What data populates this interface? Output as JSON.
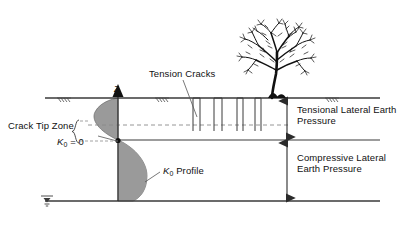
{
  "diagram": {
    "colors": {
      "line": "#3a3a3a",
      "shade_fill": "#9a9a9a",
      "dashed": "#808080",
      "text": "#111111",
      "tree": "#111111"
    },
    "labels": {
      "tension_cracks": "Tension Cracks",
      "crack_tip_zone": "Crack Tip Zone",
      "k0_zero_k": "K",
      "k0_zero_sub": "0",
      "k0_zero_eq": " = 0",
      "k0_profile_k": "K",
      "k0_profile_sub": "0",
      "k0_profile_rest": " Profile",
      "depth_axis": "z",
      "tensional_pressure": "Tensional Lateral Earth Pressure",
      "compressive_pressure": "Compressive Lateral Earth Pressure"
    },
    "icons": {
      "tree": "tree-icon",
      "water_table": "water-table-icon",
      "ground_hatch": "ground-hatch-icon",
      "depth_arrow": "depth-arrow-icon",
      "brace": "curly-brace-icon"
    },
    "geometry": {
      "ground_line_y": 98,
      "dashed_line_y": 125,
      "crack_tip_line_y": 140,
      "bottom_line_y": 201,
      "axis_x": 118,
      "left_x": 45,
      "right_x": 380,
      "arrow_x": 287,
      "crack_count": 4
    }
  }
}
